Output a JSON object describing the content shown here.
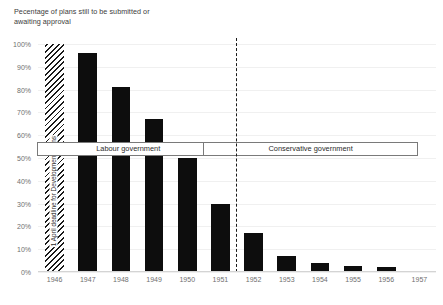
{
  "chart_data": {
    "type": "bar",
    "title": "Pecentage of plans still to be submitted or awaiting approval",
    "xlabel": "",
    "ylabel": "",
    "ylim": [
      0,
      100
    ],
    "grid": true,
    "legend": "none",
    "categories": [
      "1946",
      "1947",
      "1948",
      "1949",
      "1950",
      "1951",
      "1952",
      "1953",
      "1954",
      "1955",
      "1956",
      "1957"
    ],
    "values": [
      null,
      96,
      81,
      67,
      50,
      30,
      17,
      7,
      4,
      2.5,
      2,
      null
    ],
    "ytick_labels": [
      "0%",
      "10%",
      "20%",
      "30%",
      "40%",
      "50%",
      "60%",
      "70%",
      "80%",
      "90%",
      "100%"
    ],
    "ytick_values": [
      0,
      10,
      20,
      30,
      40,
      50,
      60,
      70,
      80,
      90,
      100
    ],
    "bar_color": "#0d0d0d",
    "annotations": [
      {
        "name": "deadline-band",
        "text": "1 April deadline for Development Plans",
        "at_category": "1946",
        "style": "diagonal-hatch"
      },
      {
        "name": "labour-government",
        "text": "Labour government",
        "from_category": "1946",
        "to_category": "1951"
      },
      {
        "name": "conservative-government",
        "text": "Conservative government",
        "from_category": "1951",
        "to_category": "1957"
      },
      {
        "name": "government-change-divider",
        "text": "",
        "at_category": "1951",
        "style": "dashed-vertical"
      }
    ]
  },
  "colors": {
    "bar": "#0d0d0d",
    "grid": "#f0f0f0",
    "axis_text": "#6f6f6f",
    "title_text": "#3b3b3b",
    "box_border": "#7a7a7a",
    "background": "#ffffff"
  }
}
